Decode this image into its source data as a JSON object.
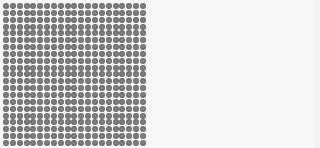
{
  "grid": {
    "rows": 21,
    "columns": 21,
    "dot_color": "#6b6b6b",
    "background_color": "#f7f7f7"
  }
}
